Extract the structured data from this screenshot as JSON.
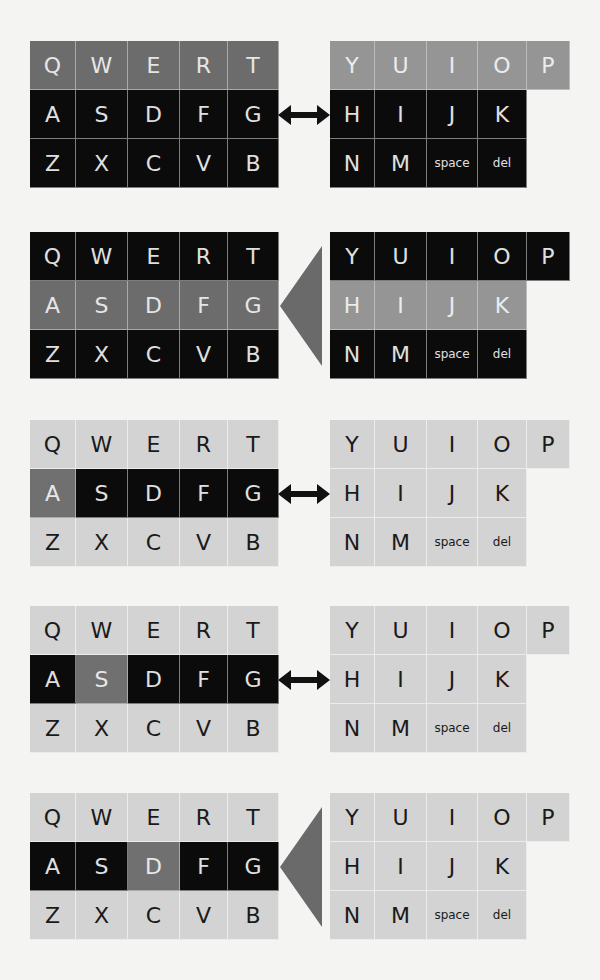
{
  "figure": {
    "colors": {
      "background": "#f4f4f2",
      "mid_gray": "#6c6c6c",
      "light_mid_gray": "#959595",
      "black": "#0b0b0b",
      "light_gray": "#d3d3d3",
      "highlight_gray": "#707070",
      "triangle": "#6a6a6a"
    },
    "panels": [
      {
        "id": 1,
        "connector": "double-arrow",
        "left": {
          "rows": [
            {
              "keys": [
                "Q",
                "W",
                "E",
                "R",
                "T"
              ],
              "styles": [
                "mid",
                "mid",
                "mid",
                "mid",
                "mid"
              ]
            },
            {
              "keys": [
                "A",
                "S",
                "D",
                "F",
                "G"
              ],
              "styles": [
                "dark",
                "dark",
                "dark",
                "dark",
                "dark"
              ]
            },
            {
              "keys": [
                "Z",
                "X",
                "C",
                "V",
                "B"
              ],
              "styles": [
                "dark",
                "dark",
                "dark",
                "dark",
                "dark"
              ]
            }
          ]
        },
        "right": {
          "rows": [
            {
              "keys": [
                "Y",
                "U",
                "I",
                "O",
                "P"
              ],
              "styles": [
                "lmid",
                "lmid",
                "lmid",
                "lmid",
                "lmid"
              ]
            },
            {
              "keys": [
                "H",
                "I",
                "J",
                "K"
              ],
              "styles": [
                "dark",
                "dark",
                "dark",
                "dark"
              ]
            },
            {
              "keys": [
                "N",
                "M",
                "space",
                "del"
              ],
              "styles": [
                "dark",
                "dark",
                "dark",
                "dark"
              ]
            }
          ]
        }
      },
      {
        "id": 2,
        "connector": "triangle-pointer",
        "left": {
          "rows": [
            {
              "keys": [
                "Q",
                "W",
                "E",
                "R",
                "T"
              ],
              "styles": [
                "dark",
                "dark",
                "dark",
                "dark",
                "dark"
              ]
            },
            {
              "keys": [
                "A",
                "S",
                "D",
                "F",
                "G"
              ],
              "styles": [
                "mid",
                "mid",
                "mid",
                "mid",
                "mid"
              ]
            },
            {
              "keys": [
                "Z",
                "X",
                "C",
                "V",
                "B"
              ],
              "styles": [
                "dark",
                "dark",
                "dark",
                "dark",
                "dark"
              ]
            }
          ]
        },
        "right": {
          "rows": [
            {
              "keys": [
                "Y",
                "U",
                "I",
                "O",
                "P"
              ],
              "styles": [
                "dark",
                "dark",
                "dark",
                "dark",
                "dark"
              ]
            },
            {
              "keys": [
                "H",
                "I",
                "J",
                "K"
              ],
              "styles": [
                "lmid",
                "lmid",
                "lmid",
                "lmid"
              ]
            },
            {
              "keys": [
                "N",
                "M",
                "space",
                "del"
              ],
              "styles": [
                "dark",
                "dark",
                "dark",
                "dark"
              ]
            }
          ]
        }
      },
      {
        "id": 3,
        "connector": "double-arrow",
        "left": {
          "rows": [
            {
              "keys": [
                "Q",
                "W",
                "E",
                "R",
                "T"
              ],
              "styles": [
                "light",
                "light",
                "light",
                "light",
                "light"
              ]
            },
            {
              "keys": [
                "A",
                "S",
                "D",
                "F",
                "G"
              ],
              "styles": [
                "hl",
                "dark",
                "dark",
                "dark",
                "dark"
              ]
            },
            {
              "keys": [
                "Z",
                "X",
                "C",
                "V",
                "B"
              ],
              "styles": [
                "light",
                "light",
                "light",
                "light",
                "light"
              ]
            }
          ]
        },
        "right": {
          "rows": [
            {
              "keys": [
                "Y",
                "U",
                "I",
                "O",
                "P"
              ],
              "styles": [
                "light",
                "light",
                "light",
                "light",
                "light"
              ]
            },
            {
              "keys": [
                "H",
                "I",
                "J",
                "K"
              ],
              "styles": [
                "light",
                "light",
                "light",
                "light"
              ]
            },
            {
              "keys": [
                "N",
                "M",
                "space",
                "del"
              ],
              "styles": [
                "light",
                "light",
                "light",
                "light"
              ]
            }
          ]
        }
      },
      {
        "id": 4,
        "connector": "double-arrow",
        "left": {
          "rows": [
            {
              "keys": [
                "Q",
                "W",
                "E",
                "R",
                "T"
              ],
              "styles": [
                "light",
                "light",
                "light",
                "light",
                "light"
              ]
            },
            {
              "keys": [
                "A",
                "S",
                "D",
                "F",
                "G"
              ],
              "styles": [
                "dark",
                "hl",
                "dark",
                "dark",
                "dark"
              ]
            },
            {
              "keys": [
                "Z",
                "X",
                "C",
                "V",
                "B"
              ],
              "styles": [
                "light",
                "light",
                "light",
                "light",
                "light"
              ]
            }
          ]
        },
        "right": {
          "rows": [
            {
              "keys": [
                "Y",
                "U",
                "I",
                "O",
                "P"
              ],
              "styles": [
                "light",
                "light",
                "light",
                "light",
                "light"
              ]
            },
            {
              "keys": [
                "H",
                "I",
                "J",
                "K"
              ],
              "styles": [
                "light",
                "light",
                "light",
                "light"
              ]
            },
            {
              "keys": [
                "N",
                "M",
                "space",
                "del"
              ],
              "styles": [
                "light",
                "light",
                "light",
                "light"
              ]
            }
          ]
        }
      },
      {
        "id": 5,
        "connector": "triangle-pointer",
        "left": {
          "rows": [
            {
              "keys": [
                "Q",
                "W",
                "E",
                "R",
                "T"
              ],
              "styles": [
                "light",
                "light",
                "light",
                "light",
                "light"
              ]
            },
            {
              "keys": [
                "A",
                "S",
                "D",
                "F",
                "G"
              ],
              "styles": [
                "dark",
                "dark",
                "hl",
                "dark",
                "dark"
              ]
            },
            {
              "keys": [
                "Z",
                "X",
                "C",
                "V",
                "B"
              ],
              "styles": [
                "light",
                "light",
                "light",
                "light",
                "light"
              ]
            }
          ]
        },
        "right": {
          "rows": [
            {
              "keys": [
                "Y",
                "U",
                "I",
                "O",
                "P"
              ],
              "styles": [
                "light",
                "light",
                "light",
                "light",
                "light"
              ]
            },
            {
              "keys": [
                "H",
                "I",
                "J",
                "K"
              ],
              "styles": [
                "light",
                "light",
                "light",
                "light"
              ]
            },
            {
              "keys": [
                "N",
                "M",
                "space",
                "del"
              ],
              "styles": [
                "light",
                "light",
                "light",
                "light"
              ]
            }
          ]
        }
      }
    ]
  }
}
